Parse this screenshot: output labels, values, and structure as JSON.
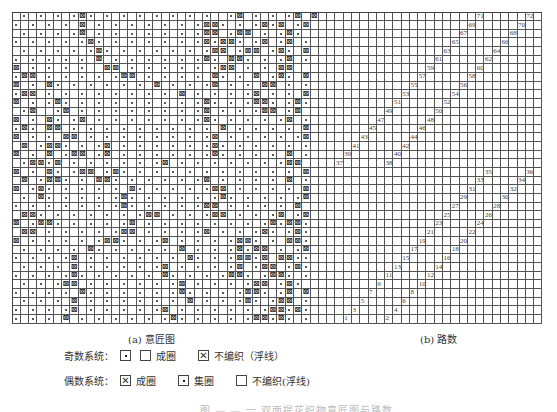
{
  "figure": {
    "grid": {
      "cols": 64,
      "rows": 36,
      "section_a_cols": 38,
      "cell_w": 8.28,
      "cell_h": 8.64
    },
    "section_a": {
      "label": "(a) 意匠图",
      "legend_key": {
        ".": "dot",
        "x": "x-mark",
        " ": "blank"
      },
      "rows": [
        " . . . .x. . . . . . . .  .x . . .x x",
        ". . . . x . . . . . . .xx. . .x.x .x",
        " . . . .x . . . . . . .xx .xx . .x. ",
        ". . . . .x. . . . . . .x.xx. .x .x .",
        " . . . . .x. . . . . . .xx .xx .x. x",
        ". . . . . x . . . . . .x. xx. . .x .",
        "x . . . .  xx . . . . . .xx . . xx  ",
        ".xx . . . . .xx . . . . x. . x .x. x",
        "x . x. . . . . . x . . .x . . xx . .",
        ".xx . . . . . . . . x . . . .x . . x",
        "x . .x. . . . . . . . .x. . .xx. .x.",
        " .x  .x . . . . . . . .x . . .xx .x ",
        "x . x. .x . . . . . . .x. . . . .x .",
        ".x. xx . . . . . . . . . x . . . . x",
        "x . . xx . . . . . . . .x . . . . .x",
        " x .xx. . .x . . . . . .x. . . . . .",
        "x . x .xx .x . . . . . .x. . . . x .",
        " .xx.x . . . . . .x . . . . . . .xx ",
        "x . x. .xx .x. . . . . . . . . . . x",
        " x .xx. . xx. . . . . .x . . . . x .",
        "x .x. . . . . x. . . . .xx . . . . x",
        " . x. . . . .x. . . . . .x. . . . .x",
        ". . . . . . .x. . . . .xx . . . . x ",
        " xx. . . . . . .xx . . .xx . . .x .x",
        "x .xx. . . . .x . . . . . . . .x.xx.",
        " xx . . . . .xx . . . .x . . .x. .x.",
        "x . . . . .xx. . .x . . . .xx. . xx.",
        " . . . . x. . . . . x . . .x.xx . .x",
        ". . . .x . . . . . . x. . .xx.x xx..",
        " . . . x . . . . .x . . . .x .xx .x.",
        ". . . .x. . . . . x. . . .xx. .xx. .",
        " . . .xx . . . . . .x . . . .xx .x.",
        ". . . . x. . . . . .x. . . .xx. .x x",
        " . . . x . . . . . . x . . .x. .xx .",
        ". . . .x . . . . .x . . . . . .xx.x.",
        ". . . x . . . . . .x. . . . .xx.x. ."
      ]
    },
    "section_b": {
      "label": "(b) 路数",
      "numbers": [
        1,
        2,
        3,
        4,
        5,
        6,
        7,
        8,
        9,
        10,
        11,
        12,
        13,
        14,
        15,
        16,
        17,
        18,
        19,
        20,
        21,
        22,
        23,
        24,
        25,
        26,
        27,
        28,
        29,
        30,
        31,
        32,
        33,
        34,
        35,
        36,
        37,
        38,
        39,
        40,
        41,
        42,
        43,
        44,
        45,
        46,
        47,
        48,
        49,
        50,
        51,
        52,
        53,
        54,
        55,
        56,
        57,
        58,
        59,
        60,
        61,
        62,
        63,
        64,
        65,
        66,
        67,
        68,
        69,
        70,
        71,
        72
      ]
    },
    "legend": {
      "odd_system": {
        "title": "奇数系统：",
        "items": [
          {
            "symbol": "dot",
            "label": ""
          },
          {
            "symbol": "blank",
            "label": "成圈"
          },
          {
            "symbol": "x",
            "label": "不编织（浮线）"
          }
        ]
      },
      "even_system": {
        "title": "偶数系统：",
        "items": [
          {
            "symbol": "x",
            "label": "成圈"
          },
          {
            "symbol": "dot",
            "label": "集圈"
          },
          {
            "symbol": "blank",
            "label": "不编织(浮线)"
          }
        ]
      }
    },
    "caption": "图 — — 一 双面提花织物意匠图与路数"
  }
}
